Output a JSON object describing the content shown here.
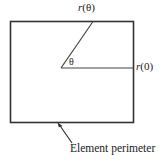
{
  "figure": {
    "background_color": "#ffffff",
    "line_color": "#333333",
    "text_color": "#1b1b1b",
    "labels": {
      "radius_theta_italic": "r",
      "radius_theta_arg": "(θ)",
      "radius_zero_italic": "r",
      "radius_zero_arg": "(0)",
      "angle_symbol": "θ",
      "perimeter_caption": "Element perimeter"
    },
    "geometry": {
      "rect": {
        "x": 10,
        "y": 21,
        "width": 123,
        "height": 101
      },
      "vertex": {
        "x": 61,
        "y": 68
      },
      "ray_theta_end": {
        "x": 93,
        "y": 21
      },
      "ray_zero_end": {
        "x": 133,
        "y": 68
      },
      "arrow_tip": {
        "x": 58,
        "y": 123
      },
      "arrow_tail": {
        "x": 73,
        "y": 144
      }
    }
  }
}
